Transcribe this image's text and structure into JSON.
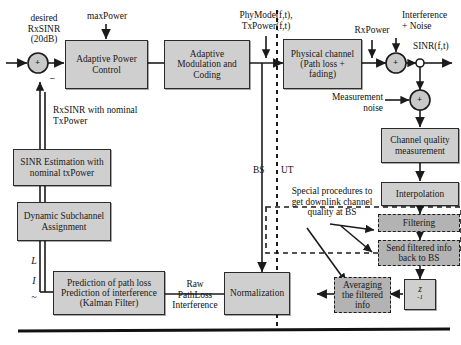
{
  "diagram": {
    "colors": {
      "block_fill": "#cfcfcf",
      "dashed_block_fill": "#b3b3b3",
      "stroke": "#2b2b2b",
      "background": "#ffffff"
    },
    "blocks": [
      {
        "id": "apc",
        "label": "Adaptive Power\nControl",
        "style": "solid"
      },
      {
        "id": "amc",
        "label": "Adaptive Modulation\nand Coding",
        "style": "solid"
      },
      {
        "id": "chan",
        "label": "Physical channel\n(Path loss + fading)",
        "style": "solid"
      },
      {
        "id": "cqm",
        "label": "Channel quality\nmeasurement",
        "style": "solid"
      },
      {
        "id": "interp",
        "label": "Interpolation",
        "style": "solid"
      },
      {
        "id": "filt",
        "label": "Filtering",
        "style": "dashed"
      },
      {
        "id": "send",
        "label": "Send filtered info\nback to BS",
        "style": "dashed"
      },
      {
        "id": "avg",
        "label": "Averaging the\nfiltered info",
        "style": "dashed"
      },
      {
        "id": "zinv",
        "label": "z",
        "style": "solid",
        "exponent": "-1"
      },
      {
        "id": "norm",
        "label": "Normalization",
        "style": "solid"
      },
      {
        "id": "pred",
        "label": "Prediction of path loss\nPrediction of interference\n(Kalman Filter)",
        "style": "solid"
      },
      {
        "id": "dsa",
        "label": "Dynamic Subchannel\nAssignment",
        "style": "solid"
      },
      {
        "id": "sinrest",
        "label": "SINR Estimation with\nnominal txPower",
        "style": "solid"
      }
    ],
    "labels": {
      "desired_rxsinr": "desired\nRxSINR\n(20dB)",
      "max_power": "maxPower",
      "phymode_txpower": "PhyMode(f,t),\nTxPower(f,t)",
      "rx_power": "RxPower",
      "interference_noise": "Interference\n+ Noise",
      "sinr_ft": "SINR(f,t)",
      "measurement_noise": "Measurement\nnoise",
      "rxsinr_nominal": "RxSINR with nominal\nTxPower",
      "bs": "BS",
      "ut": "UT",
      "special_procedures": "Special procedures to\nget downlink channel\nquality at BS",
      "raw_pathloss": "Raw\nPathLoss\nInterference",
      "var_l": "L",
      "var_i": "I",
      "var_dash": "~",
      "summer_plus": "+",
      "summer_minus": "–"
    }
  }
}
